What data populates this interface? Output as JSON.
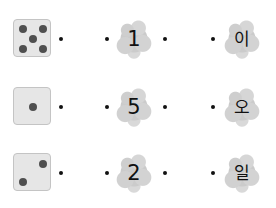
{
  "worksheet": {
    "rows": [
      {
        "die_value": 5,
        "numeral": "1",
        "korean": "이"
      },
      {
        "die_value": 1,
        "numeral": "5",
        "korean": "오"
      },
      {
        "die_value": 2,
        "numeral": "2",
        "korean": "일"
      }
    ]
  },
  "colors": {
    "die_face": "#e6e6e6",
    "die_border": "#c4c4c4",
    "pip": "#4f4f4f",
    "blob": "#c8c8c8",
    "dot": "#111111"
  }
}
